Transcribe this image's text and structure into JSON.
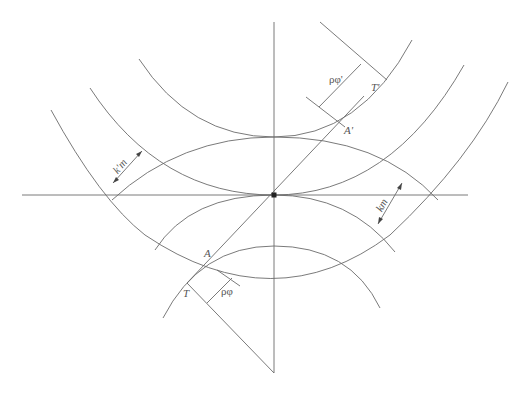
{
  "diagram": {
    "labels": {
      "T_upper": "T'",
      "A_upper": "A'",
      "rho_phi_upper": "ρφ'",
      "k_prime_m": "k'm",
      "km": "km",
      "A_lower": "A",
      "T_lower": "T",
      "rho_phi_lower": "ρφ"
    },
    "colors": {
      "line": "#6b6b6b",
      "background": "#ffffff",
      "center_point": "#222222"
    }
  }
}
